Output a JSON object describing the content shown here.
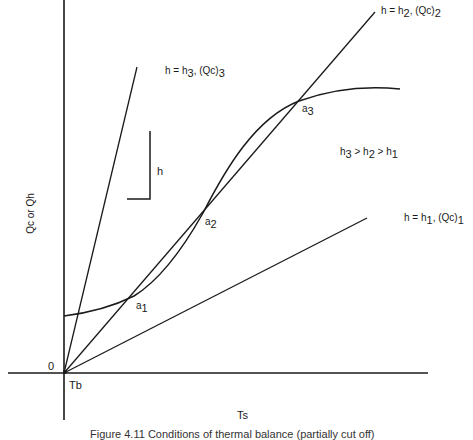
{
  "diagram": {
    "axes": {
      "origin_label": "0",
      "origin_point_label": "Tb",
      "x_label": "Ts",
      "y_label": "Qc or Qh"
    },
    "lines": [
      {
        "id": "h3",
        "label": "h = h3, (Qc)3",
        "text_main": "h = h",
        "sub1": "3",
        "text_mid": ", (Qc)",
        "sub2": "3"
      },
      {
        "id": "h2",
        "label": "h = h2, (Qc)2",
        "text_main": "h = h",
        "sub1": "2",
        "text_mid": ", (Qc)",
        "sub2": "2"
      },
      {
        "id": "h1",
        "label": "h = h1, (Qc)1",
        "text_main": "h = h",
        "sub1": "1",
        "text_mid": ", (Qc)",
        "sub2": "1"
      }
    ],
    "slope_triangle_label": "h",
    "inequality": {
      "h3": "h",
      "s3": "3",
      "gt1": " > h",
      "s2": "2",
      "gt2": " > h",
      "s1": "1",
      "full": "h3 > h2 > h1"
    },
    "points": [
      {
        "id": "a1",
        "text": "a",
        "sub": "1"
      },
      {
        "id": "a2",
        "text": "a",
        "sub": "2"
      },
      {
        "id": "a3",
        "text": "a",
        "sub": "3"
      }
    ],
    "curve_label": "Qh (heat generation curve)",
    "caption": "Figure 4.11  Conditions of thermal balance (partially cut off)"
  },
  "colors": {
    "ink": "#1a1a1a",
    "background": "#ffffff"
  }
}
